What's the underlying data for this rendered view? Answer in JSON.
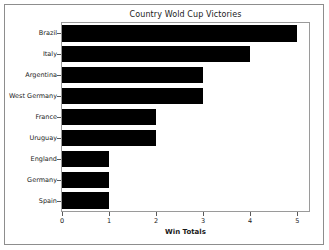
{
  "chart_data": {
    "type": "bar",
    "orientation": "horizontal",
    "title": "Country Wold Cup Victories",
    "xlabel": "Win Totals",
    "ylabel": "",
    "categories": [
      "Brazil",
      "Italy",
      "Argentina",
      "West Germany",
      "France",
      "Uruguay",
      "England",
      "Germany",
      "Spain"
    ],
    "values": [
      5,
      4,
      3,
      3,
      2,
      2,
      1,
      1,
      1
    ],
    "xticks": [
      "0",
      "1",
      "2",
      "3",
      "4",
      "5"
    ],
    "xtick_values": [
      0,
      1,
      2,
      3,
      4,
      5
    ],
    "xlim": [
      0,
      5.25
    ],
    "grid": false,
    "legend": null,
    "bar_color": "#000000",
    "background_color": "#ffffff",
    "axes_edge_color": "#9a9a9a"
  }
}
